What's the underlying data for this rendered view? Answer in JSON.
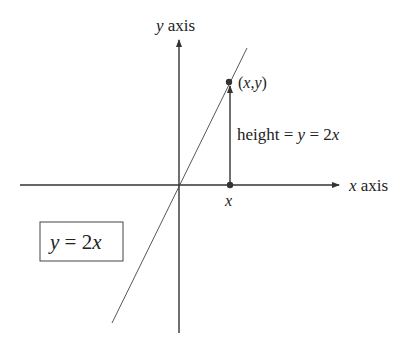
{
  "diagram": {
    "labels": {
      "y_axis_var": "y",
      "y_axis_word": " axis",
      "x_axis_var": "x",
      "x_axis_word": " axis",
      "point_label": "(x,y)",
      "point_open": "(",
      "point_x": "x",
      "point_comma": ",",
      "point_y": "y",
      "point_close": ")",
      "height_word": "height = ",
      "height_y": "y",
      "height_eq": " = 2",
      "height_x": "x",
      "x_tick_label": "x",
      "equation_y": "y",
      "equation_mid": " = 2",
      "equation_x": "x",
      "equation_full": "y = 2x"
    },
    "colors": {
      "ink": "#222222",
      "line": "#444444",
      "background": "#ffffff"
    }
  }
}
